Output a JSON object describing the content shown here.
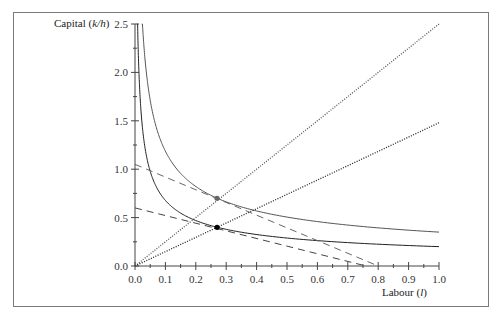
{
  "chart_data": {
    "type": "line",
    "title": "",
    "xlabel": "Labour (l)",
    "xlabel_text": "Labour (",
    "xlabel_var": "l",
    "ylabel": "Capital (k/h)",
    "ylabel_text": "Capital (",
    "ylabel_var": "k/h",
    "xlim": [
      0.0,
      1.0
    ],
    "ylim": [
      0.0,
      2.5
    ],
    "x_ticks": [
      "0.0",
      "0.1",
      "0.2",
      "0.3",
      "0.4",
      "0.5",
      "0.6",
      "0.7",
      "0.8",
      "0.9",
      "1.0"
    ],
    "y_ticks": [
      "0.0",
      "0.5",
      "1.0",
      "1.5",
      "2.0",
      "2.5"
    ],
    "grid": false,
    "legend": null,
    "series": [
      {
        "name": "isoquant-upper",
        "style": "solid",
        "color": "#555555",
        "formula": "y = 0.35 * x^-0.53",
        "x_range": [
          0.022,
          1.0
        ]
      },
      {
        "name": "isoquant-lower",
        "style": "solid",
        "color": "#222222",
        "formula": "y = 0.20 * x^-0.53",
        "x_range": [
          0.006,
          1.0
        ]
      },
      {
        "name": "ray-steep",
        "style": "dotted",
        "color": "#555555",
        "points": [
          [
            0.0,
            0.0
          ],
          [
            1.0,
            2.5
          ]
        ]
      },
      {
        "name": "ray-shallow",
        "style": "dotted",
        "color": "#222222",
        "points": [
          [
            0.0,
            0.0
          ],
          [
            1.0,
            1.48
          ]
        ]
      },
      {
        "name": "isocost-upper",
        "style": "dashed",
        "color": "#666666",
        "points": [
          [
            0.0,
            1.05
          ],
          [
            0.8,
            0.0
          ]
        ]
      },
      {
        "name": "isocost-lower",
        "style": "dashed",
        "color": "#444444",
        "points": [
          [
            0.0,
            0.6
          ],
          [
            0.76,
            0.0
          ]
        ]
      }
    ],
    "points": [
      {
        "name": "tangency-upper",
        "x": 0.27,
        "y": 0.7,
        "color": "#666666"
      },
      {
        "name": "tangency-lower",
        "x": 0.27,
        "y": 0.4,
        "color": "#000000"
      }
    ]
  }
}
